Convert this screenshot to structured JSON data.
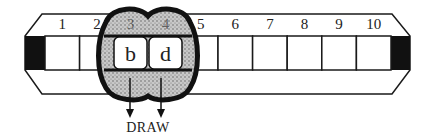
{
  "diagram": {
    "type": "tape-with-read-head",
    "cell_numbers": [
      "1",
      "2",
      "3",
      "4",
      "5",
      "6",
      "7",
      "8",
      "9",
      "10"
    ],
    "head": {
      "covers_cells": [
        3,
        4
      ],
      "symbols": [
        "b",
        "d"
      ]
    },
    "action_label": "DRAW",
    "colors": {
      "stroke": "#1a1a1a",
      "end_cap": "#111111",
      "head_fill": "#b8b8b8",
      "cell_fill": "#ffffff"
    }
  }
}
